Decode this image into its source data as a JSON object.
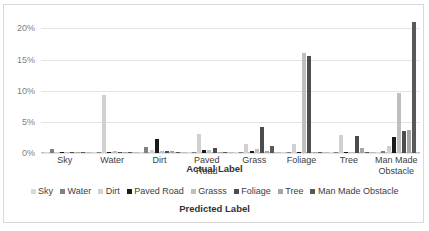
{
  "chart_data": {
    "type": "bar",
    "title": "",
    "xlabel": "Predicted Label",
    "secondary_xlabel": "Actual Label",
    "ylabel": "",
    "ylim": [
      0,
      22
    ],
    "grid": true,
    "legend_position": "bottom",
    "yticks": [
      "0%",
      "5%",
      "10%",
      "15%",
      "20%"
    ],
    "ytick_values": [
      0,
      5,
      10,
      15,
      20
    ],
    "categories": [
      "Sky",
      "Water",
      "Dirt",
      "Paved Road",
      "Grass",
      "Foliage",
      "Tree",
      "Man Made Obstacle"
    ],
    "series": [
      {
        "name": "Sky",
        "color": "#d9d9d9",
        "values": [
          0.15,
          0.1,
          0.08,
          0.05,
          0.08,
          0.1,
          0.08,
          0.1
        ]
      },
      {
        "name": "Water",
        "color": "#808080",
        "values": [
          0.6,
          0.12,
          0.95,
          0.1,
          0.1,
          0.1,
          0.1,
          0.35
        ]
      },
      {
        "name": "Dirt",
        "color": "#d0d0d0",
        "values": [
          0.1,
          9.35,
          0.55,
          3.0,
          1.5,
          1.45,
          2.95,
          1.15
        ]
      },
      {
        "name": "Paved Road",
        "color": "#1a1a1a",
        "values": [
          0.08,
          0.1,
          2.3,
          0.45,
          0.25,
          0.08,
          0.1,
          2.65
        ]
      },
      {
        "name": "Grasss",
        "color": "#bfbfbf",
        "values": [
          0.08,
          0.35,
          0.4,
          0.55,
          0.6,
          16.05,
          0.2,
          9.6
        ]
      },
      {
        "name": "Foliage",
        "color": "#4d4d4d",
        "values": [
          0.08,
          0.12,
          0.3,
          0.85,
          4.2,
          15.55,
          2.8,
          3.6
        ]
      },
      {
        "name": "Tree",
        "color": "#a6a6a6",
        "values": [
          0.08,
          0.1,
          0.35,
          0.15,
          0.3,
          0.15,
          0.8,
          3.7
        ]
      },
      {
        "name": "Man Made Obstacle",
        "color": "#595959",
        "values": [
          0.08,
          0.1,
          0.2,
          0.12,
          1.2,
          0.2,
          0.15,
          21.05
        ]
      }
    ]
  },
  "legend": {
    "items": [
      {
        "label": "Sky"
      },
      {
        "label": "Water"
      },
      {
        "label": "Dirt"
      },
      {
        "label": "Paved Road"
      },
      {
        "label": "Grasss"
      },
      {
        "label": "Foliage"
      },
      {
        "label": "Tree"
      },
      {
        "label": "Man Made Obstacle"
      }
    ]
  }
}
